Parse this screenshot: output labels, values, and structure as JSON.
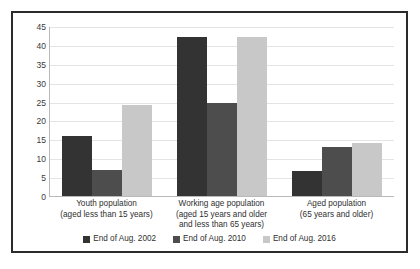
{
  "chart_data": {
    "type": "bar",
    "title": "",
    "xlabel": "",
    "ylabel": "",
    "ylim": [
      0,
      45
    ],
    "ystep": 5,
    "grid": true,
    "legend_position": "bottom",
    "yticks": [
      "45",
      "40",
      "35",
      "30",
      "25",
      "20",
      "15",
      "10",
      "5",
      "0"
    ],
    "categories": [
      "Youth population\n(aged less than 15 years)",
      "Working age population\n(aged 15 years and older\nand less than 65 years)",
      "Aged population\n(65 years and older)"
    ],
    "category_lines": [
      [
        "Youth population",
        "(aged less than 15 years)"
      ],
      [
        "Working age population",
        "(aged 15 years and older",
        "and less than 65 years)"
      ],
      [
        "Aged population",
        "(65 years and older)"
      ]
    ],
    "series": [
      {
        "name": "End of Aug. 2002",
        "color": "#333333",
        "values": [
          16,
          42,
          6.5
        ]
      },
      {
        "name": "End of Aug. 2010",
        "color": "#4d4d4d",
        "values": [
          7,
          24.5,
          13
        ]
      },
      {
        "name": "End of Aug. 2016",
        "color": "#c8c8c8",
        "values": [
          24,
          42,
          14
        ]
      }
    ]
  },
  "legend": {
    "items": [
      {
        "label": "End of Aug. 2002",
        "color": "#333333"
      },
      {
        "label": "End of Aug. 2010",
        "color": "#4d4d4d"
      },
      {
        "label": "End of Aug. 2016",
        "color": "#c8c8c8"
      }
    ]
  }
}
